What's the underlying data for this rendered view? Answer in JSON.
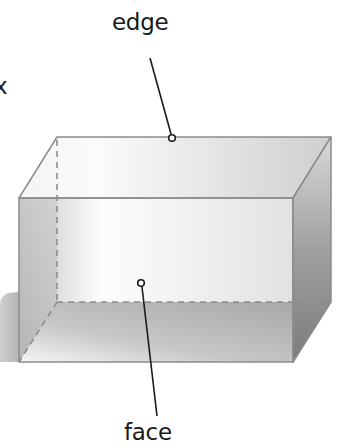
{
  "diagram": {
    "type": "rectangular-prism",
    "labels": {
      "edge": "edge",
      "face": "face",
      "partial_left": "x"
    },
    "colors": {
      "outline": "#8c8c8c",
      "hidden_edge": "#8c8c8c",
      "pointer": "#1a1a1a",
      "text": "#1a1a1a"
    }
  }
}
